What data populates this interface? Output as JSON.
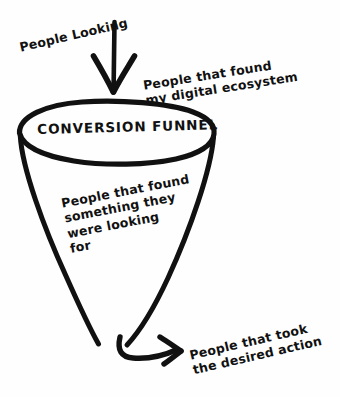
{
  "diagram": {
    "title": "Conversion Funnel",
    "type": "hand-drawn-funnel-diagram",
    "background_color": "#fefefe",
    "ink_color": "#111111",
    "funnel_label": "CONVERSION FUNNEL",
    "labels": {
      "top_input": "People Looking",
      "top_right": "People that found\nmy digital ecosystem",
      "inside_funnel": "People that found\nsomething they\nwere looking\nfor",
      "bottom_output": "People that took\nthe desired action"
    },
    "arrows": {
      "inflow_icon": "arrow-down-icon",
      "outflow_icon": "arrow-curve-right-icon"
    },
    "stages": [
      {
        "stage": 1,
        "label": "People Looking",
        "position": "top-inflow"
      },
      {
        "stage": 2,
        "label": "People that found my digital ecosystem",
        "position": "funnel-mouth"
      },
      {
        "stage": 3,
        "label": "People that found something they were looking for",
        "position": "funnel-body"
      },
      {
        "stage": 4,
        "label": "People that took the desired action",
        "position": "funnel-outflow"
      }
    ]
  }
}
